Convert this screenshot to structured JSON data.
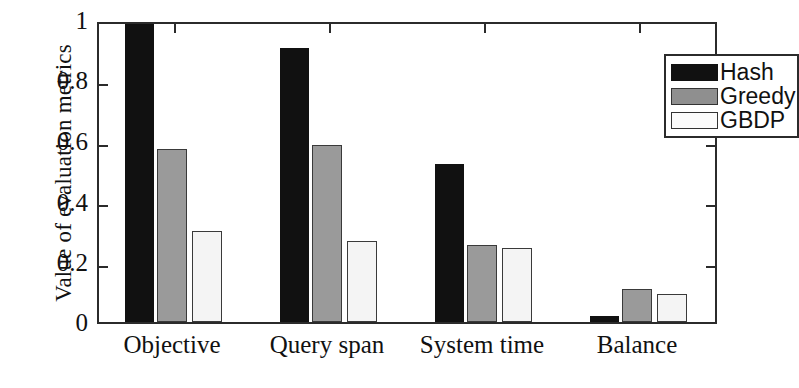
{
  "chart_data": {
    "type": "bar",
    "title": "",
    "xlabel": "",
    "ylabel": "Value of evaluation metrics",
    "categories": [
      "Objective",
      "Query span",
      "System time",
      "Balance"
    ],
    "ylim": [
      0,
      1
    ],
    "yticks": [
      "0",
      "0.2",
      "0.4",
      "0.6",
      "0.8",
      "1"
    ],
    "ytick_values": [
      0,
      0.2,
      0.4,
      0.6,
      0.8,
      1
    ],
    "grid": false,
    "legend_position": "top-right",
    "series": [
      {
        "name": "Hash",
        "color": "#111111",
        "values": [
          1.0,
          0.92,
          0.53,
          0.02
        ]
      },
      {
        "name": "Greedy",
        "color": "#9a9a9a",
        "values": [
          0.58,
          0.595,
          0.257,
          0.11
        ]
      },
      {
        "name": "GBDP",
        "color": "#f4f4f4",
        "values": [
          0.305,
          0.272,
          0.247,
          0.095
        ]
      }
    ]
  },
  "legend": {
    "items": [
      {
        "label": "Hash"
      },
      {
        "label": "Greedy"
      },
      {
        "label": "GBDP"
      }
    ]
  },
  "axes": {
    "y_title": "Value of evaluation metrics",
    "y_ticks": [
      "1",
      "0.8",
      "0.6",
      "0.4",
      "0.2",
      "0"
    ],
    "x_ticks": [
      "Objective",
      "Query span",
      "System time",
      "Balance"
    ]
  }
}
